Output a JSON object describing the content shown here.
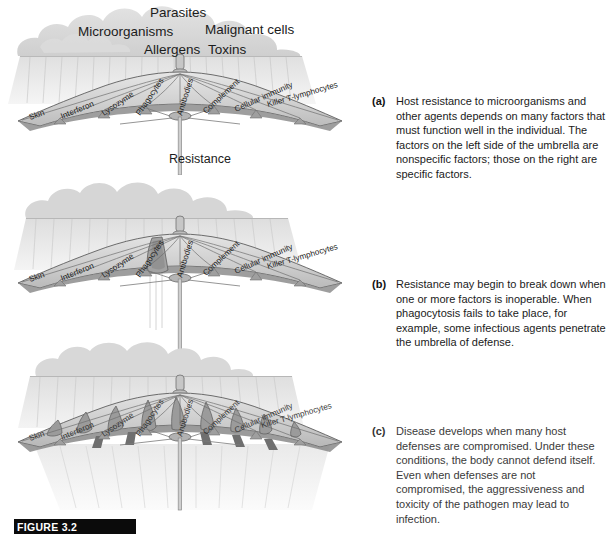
{
  "figure": {
    "bar_label": "FIGURE 3.2",
    "resistance_label": "Resistance"
  },
  "cloud_labels": {
    "parasites": "Parasites",
    "microorganisms": "Microorganisms",
    "malignant_cells": "Malignant cells",
    "allergens": "Allergens",
    "toxins": "Toxins"
  },
  "umbrella": {
    "rib_labels": [
      "Skin",
      "Interferon",
      "Lysozyme",
      "Phagocytes",
      "Antibodies",
      "Complement",
      "Cellular immunity",
      "Killer T-lymphocytes"
    ]
  },
  "captions": {
    "a": {
      "letter": "(a)",
      "text": "Host resistance to microorganisms and other agents depends on many factors that must function well in the individual. The factors on the left side of the umbrella are nonspecific factors; those on the right are specific factors."
    },
    "b": {
      "letter": "(b)",
      "text": "Resistance may begin to break down when one or more factors is inoperable. When phagocytosis fails to take place, for example, some infectious agents penetrate the umbrella of defense."
    },
    "c": {
      "letter": "(c)",
      "text": "Disease develops when many host defenses are compromised. Under these conditions, the body cannot defend itself. Even when defenses are not compromised, the aggressiveness and toxicity of the pathogen may lead to  infection."
    }
  },
  "colors": {
    "canopy_light": "#d9d9d9",
    "canopy_mid": "#c2c2c2",
    "canopy_dark": "#9a9a9a",
    "canopy_shadow": "#7d7d7d",
    "outline": "#4a4a4a",
    "cloud": "#d4d4d4",
    "rain": "#c9c9c9",
    "bar": "#0b0b0b",
    "text": "#1b1b1b"
  }
}
